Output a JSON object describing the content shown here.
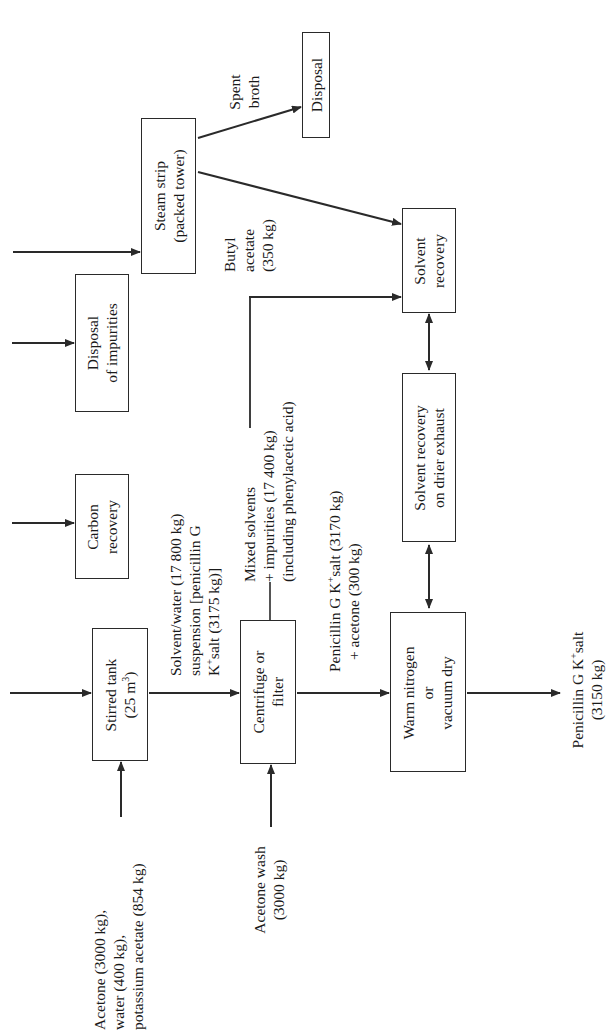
{
  "diagram": {
    "orientation": "rotated -90 degrees",
    "boxes": {
      "stirred_tank": {
        "line1": "Stirred tank",
        "line2_pre": "(25 m",
        "line2_sup": "3",
        "line2_post": ")"
      },
      "centrifuge": {
        "line1": "Centrifuge or",
        "line2": "filter"
      },
      "dryer": {
        "line1": "Warm nitrogen",
        "line2": "or",
        "line3": "vacuum dry"
      },
      "drier_exhaust_recovery": {
        "line1": "Solvent recovery",
        "line2": "on drier exhaust"
      },
      "solvent_recovery": {
        "line1": "Solvent",
        "line2": "recovery"
      },
      "steam_strip": {
        "line1": "Steam strip",
        "line2": "(packed tower)"
      },
      "disposal": {
        "line1": "Disposal"
      },
      "disposal_impurities": {
        "line1": "Disposal",
        "line2": "of impurities"
      },
      "carbon_recovery": {
        "line1": "Carbon",
        "line2": "recovery"
      }
    },
    "labels": {
      "feed": {
        "line1": "Acetone (3000 kg),",
        "line2": "water (400 kg),",
        "line3": "potassium acetate (854 kg)"
      },
      "acetone_wash": {
        "line1": "Acetone wash",
        "line2": "(3000 kg)"
      },
      "suspension": {
        "line1": "Solvent/water (17 800 kg)",
        "line2": "suspension [penicillin G",
        "line3_pre": "K",
        "line3_sup": "+",
        "line3_post": "salt (3175 kg)]"
      },
      "mixed_solvents": {
        "line1": "Mixed solvents",
        "line2": "+ impurities (17 400 kg)",
        "line3": "(including phenylacetic acid)"
      },
      "centrifuge_out": {
        "line1_pre": "Penicillin G K",
        "line1_sup": "+",
        "line1_post": "salt (3170 kg)",
        "line2": "+ acetone (300 kg)"
      },
      "product": {
        "line1_pre": "Penicillin G K",
        "line1_sup": "+",
        "line1_post": "salt",
        "line2": "(3150 kg)"
      },
      "butyl_acetate": {
        "line1": "Butyl",
        "line2": "acetate",
        "line3": "(350 kg)"
      },
      "spent_broth": {
        "line1": "Spent",
        "line2": "broth"
      }
    },
    "colors": {
      "line": "#2a2a2a",
      "text": "#1a1a1a",
      "background": "#ffffff"
    }
  }
}
